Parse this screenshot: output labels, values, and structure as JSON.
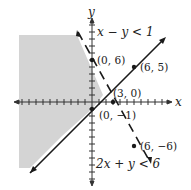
{
  "figure": {
    "type": "system-of-linear-inequalities-graph",
    "axes": {
      "x_label": "x",
      "y_label": "y",
      "x_range": [
        -11,
        11
      ],
      "y_range": [
        -11,
        10
      ],
      "tick_interval": 1
    },
    "inequalities": [
      {
        "label": "x − y < 1",
        "boundary": "x − y = 1",
        "line_style": "solid",
        "points": [
          {
            "label": "(0, −1)",
            "x": 0,
            "y": -1
          },
          {
            "label": "(6, 5)",
            "x": 6,
            "y": 5
          }
        ]
      },
      {
        "label": "2x + y < 6",
        "boundary": "2x + y = 6",
        "line_style": "dashed",
        "points": [
          {
            "label": "(0, 6)",
            "x": 0,
            "y": 6
          },
          {
            "label": "(3, 0)",
            "x": 3,
            "y": 0
          },
          {
            "label": "(6, −6)",
            "x": 6,
            "y": -6
          }
        ]
      }
    ],
    "point_labels": {
      "p06": "(0, 6)",
      "p65": "(6, 5)",
      "p30": "(3, 0)",
      "p0m1": "(0, −1)",
      "p6m6": "(6, −6)"
    },
    "inequality_labels": {
      "top": "x − y < 1",
      "bottom": "2x + y < 6"
    },
    "colors": {
      "shade": "#d4d4d4",
      "line": "#1a1a1a",
      "axis": "#333333"
    }
  }
}
